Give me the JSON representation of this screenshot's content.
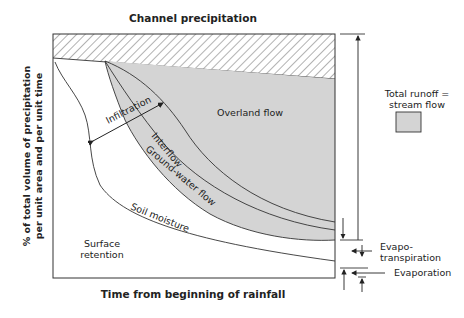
{
  "diagram": {
    "title": "Channel precipitation",
    "xlabel": "Time from beginning of rainfall",
    "ylabel_line1": "% of total volume of precipitation",
    "ylabel_line2": "per unit area and per unit time",
    "regions": {
      "overland_flow": "Overland flow",
      "infiltration": "Infiltration",
      "interflow": "Interflow",
      "groundwater_flow": "Ground-water flow",
      "soil_moisture": "Soil moisture",
      "surface_retention_line1": "Surface",
      "surface_retention_line2": "retention"
    },
    "legend": {
      "line1": "Total runoff =",
      "line2": "stream flow",
      "swatch_color": "#d4d4d4"
    },
    "right_labels": {
      "evapotranspiration_line1": "Evapo-",
      "evapotranspiration_line2": "transpiration",
      "evaporation": "Evaporation"
    },
    "colors": {
      "runoff_fill": "#d4d4d4",
      "line": "#333333",
      "hatch": "#555555"
    }
  }
}
